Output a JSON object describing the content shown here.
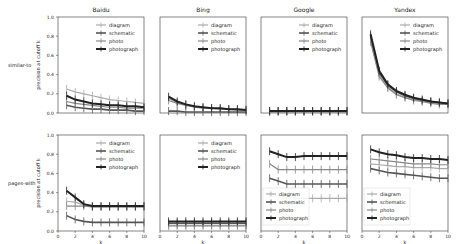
{
  "figure": {
    "row_labels": [
      "similar-to",
      "pages-with"
    ],
    "col_titles": [
      "Baidu",
      "Bing",
      "Google",
      "Yandex"
    ],
    "ylabel": "precision at cutoff k",
    "xlabel": "k",
    "yticks": [
      "0.0",
      "0.2",
      "0.4",
      "0.6",
      "0.8",
      "1.0"
    ],
    "xticks": [
      "0",
      "2",
      "4",
      "6",
      "8",
      "10"
    ]
  },
  "chart_data": {
    "type": "line",
    "title": "",
    "xlabel": "k",
    "ylabel": "precision at cutoff k",
    "xlim": [
      0,
      10
    ],
    "ylim": [
      0,
      1
    ],
    "grid": false,
    "legend_entries": [
      "diagram",
      "schematic",
      "photo",
      "photograph"
    ],
    "series_styles": {
      "diagram": {
        "color": "#aaaaaa",
        "width": 1.2
      },
      "schematic": {
        "color": "#555555",
        "width": 1.6
      },
      "photo": {
        "color": "#888888",
        "width": 1.2
      },
      "photograph": {
        "color": "#222222",
        "width": 2.0
      }
    },
    "x": [
      1,
      2,
      3,
      4,
      5,
      6,
      7,
      8,
      9,
      10
    ],
    "panels": [
      {
        "row": "similar-to",
        "engine": "Baidu",
        "legend_pos": "upper right",
        "series": [
          {
            "name": "diagram",
            "values": [
              0.25,
              0.22,
              0.2,
              0.18,
              0.16,
              0.14,
              0.13,
              0.12,
              0.11,
              0.1
            ]
          },
          {
            "name": "schematic",
            "values": [
              0.08,
              0.06,
              0.05,
              0.04,
              0.04,
              0.03,
              0.03,
              0.03,
              0.02,
              0.02
            ]
          },
          {
            "name": "photo",
            "values": [
              0.12,
              0.1,
              0.09,
              0.08,
              0.07,
              0.06,
              0.06,
              0.05,
              0.05,
              0.05
            ]
          },
          {
            "name": "photograph",
            "values": [
              0.18,
              0.14,
              0.12,
              0.1,
              0.09,
              0.08,
              0.08,
              0.07,
              0.07,
              0.06
            ]
          }
        ]
      },
      {
        "row": "similar-to",
        "engine": "Bing",
        "legend_pos": "upper right",
        "series": [
          {
            "name": "diagram",
            "values": [
              0.15,
              0.11,
              0.09,
              0.07,
              0.06,
              0.05,
              0.05,
              0.04,
              0.04,
              0.04
            ]
          },
          {
            "name": "schematic",
            "values": [
              0.02,
              0.02,
              0.01,
              0.01,
              0.01,
              0.01,
              0.01,
              0.01,
              0.01,
              0.01
            ]
          },
          {
            "name": "photo",
            "values": [
              0.13,
              0.1,
              0.08,
              0.06,
              0.05,
              0.05,
              0.04,
              0.04,
              0.03,
              0.03
            ]
          },
          {
            "name": "photograph",
            "values": [
              0.17,
              0.12,
              0.09,
              0.07,
              0.06,
              0.05,
              0.05,
              0.04,
              0.04,
              0.03
            ]
          }
        ]
      },
      {
        "row": "similar-to",
        "engine": "Google",
        "legend_pos": "upper right",
        "series": [
          {
            "name": "diagram",
            "values": [
              0.02,
              0.02,
              0.02,
              0.02,
              0.02,
              0.02,
              0.02,
              0.02,
              0.02,
              0.02
            ]
          },
          {
            "name": "schematic",
            "values": [
              0.02,
              0.02,
              0.02,
              0.02,
              0.02,
              0.02,
              0.02,
              0.02,
              0.02,
              0.02
            ]
          },
          {
            "name": "photo",
            "values": [
              0.01,
              0.01,
              0.01,
              0.01,
              0.01,
              0.01,
              0.01,
              0.01,
              0.01,
              0.01
            ]
          },
          {
            "name": "photograph",
            "values": [
              0.02,
              0.02,
              0.02,
              0.02,
              0.02,
              0.02,
              0.02,
              0.02,
              0.02,
              0.02
            ]
          }
        ]
      },
      {
        "row": "similar-to",
        "engine": "Yandex",
        "legend_pos": "upper right",
        "series": [
          {
            "name": "diagram",
            "values": [
              0.76,
              0.4,
              0.27,
              0.2,
              0.16,
              0.14,
              0.12,
              0.11,
              0.1,
              0.09
            ]
          },
          {
            "name": "schematic",
            "values": [
              0.8,
              0.42,
              0.29,
              0.22,
              0.18,
              0.15,
              0.13,
              0.12,
              0.11,
              0.1
            ]
          },
          {
            "name": "photo",
            "values": [
              0.74,
              0.38,
              0.26,
              0.19,
              0.16,
              0.13,
              0.12,
              0.1,
              0.09,
              0.09
            ]
          },
          {
            "name": "photograph",
            "values": [
              0.82,
              0.44,
              0.3,
              0.23,
              0.19,
              0.16,
              0.14,
              0.12,
              0.11,
              0.1
            ]
          }
        ]
      },
      {
        "row": "pages-with",
        "engine": "Baidu",
        "legend_pos": "upper right",
        "series": [
          {
            "name": "diagram",
            "values": [
              0.31,
              0.3,
              0.27,
              0.25,
              0.25,
              0.25,
              0.25,
              0.25,
              0.25,
              0.25
            ]
          },
          {
            "name": "schematic",
            "values": [
              0.16,
              0.12,
              0.1,
              0.09,
              0.09,
              0.09,
              0.09,
              0.09,
              0.09,
              0.09
            ]
          },
          {
            "name": "photo",
            "values": [
              0.26,
              0.26,
              0.26,
              0.25,
              0.25,
              0.25,
              0.25,
              0.25,
              0.25,
              0.25
            ]
          },
          {
            "name": "photograph",
            "values": [
              0.42,
              0.35,
              0.28,
              0.26,
              0.26,
              0.26,
              0.26,
              0.26,
              0.26,
              0.26
            ]
          }
        ]
      },
      {
        "row": "pages-with",
        "engine": "Bing",
        "legend_pos": "upper right",
        "series": [
          {
            "name": "diagram",
            "values": [
              0.05,
              0.05,
              0.05,
              0.05,
              0.05,
              0.05,
              0.05,
              0.05,
              0.05,
              0.05
            ]
          },
          {
            "name": "schematic",
            "values": [
              0.08,
              0.08,
              0.08,
              0.08,
              0.08,
              0.08,
              0.08,
              0.08,
              0.08,
              0.08
            ]
          },
          {
            "name": "photo",
            "values": [
              0.06,
              0.06,
              0.06,
              0.06,
              0.06,
              0.06,
              0.06,
              0.06,
              0.06,
              0.06
            ]
          },
          {
            "name": "photograph",
            "values": [
              0.1,
              0.1,
              0.1,
              0.1,
              0.1,
              0.1,
              0.1,
              0.1,
              0.1,
              0.1
            ]
          }
        ]
      },
      {
        "row": "pages-with",
        "engine": "Google",
        "legend_pos": "lower left",
        "series": [
          {
            "name": "diagram",
            "values": [
              0.38,
              0.37,
              0.35,
              0.34,
              0.34,
              0.34,
              0.34,
              0.34,
              0.34,
              0.34
            ]
          },
          {
            "name": "schematic",
            "values": [
              0.55,
              0.52,
              0.49,
              0.49,
              0.49,
              0.49,
              0.49,
              0.49,
              0.49,
              0.49
            ]
          },
          {
            "name": "photo",
            "values": [
              0.7,
              0.64,
              0.64,
              0.64,
              0.64,
              0.64,
              0.64,
              0.64,
              0.64,
              0.64
            ]
          },
          {
            "name": "photograph",
            "values": [
              0.83,
              0.8,
              0.77,
              0.77,
              0.78,
              0.78,
              0.78,
              0.78,
              0.78,
              0.78
            ]
          }
        ]
      },
      {
        "row": "pages-with",
        "engine": "Yandex",
        "legend_pos": "lower left",
        "series": [
          {
            "name": "diagram",
            "values": [
              0.7,
              0.69,
              0.68,
              0.67,
              0.67,
              0.66,
              0.66,
              0.66,
              0.65,
              0.65
            ]
          },
          {
            "name": "schematic",
            "values": [
              0.65,
              0.63,
              0.61,
              0.6,
              0.59,
              0.58,
              0.57,
              0.56,
              0.55,
              0.55
            ]
          },
          {
            "name": "photo",
            "values": [
              0.75,
              0.74,
              0.73,
              0.72,
              0.71,
              0.7,
              0.7,
              0.7,
              0.69,
              0.69
            ]
          },
          {
            "name": "photograph",
            "values": [
              0.85,
              0.82,
              0.8,
              0.79,
              0.77,
              0.76,
              0.76,
              0.75,
              0.75,
              0.74
            ]
          }
        ]
      }
    ]
  }
}
